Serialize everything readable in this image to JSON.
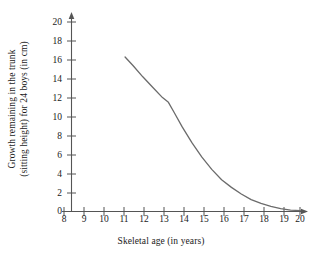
{
  "chart_data": {
    "type": "line",
    "title": "",
    "xlabel": "Skeletal age (in years)",
    "ylabel": "Growth remaining in the trunk (sitting height) for 24 boys (in cm)",
    "ylabel_line1": "Growth remaining in the trunk",
    "ylabel_line2": "(sitting height) for 24 boys (in cm)",
    "xlim": [
      8,
      20
    ],
    "ylim": [
      0,
      20
    ],
    "xticks": [
      8,
      9,
      10,
      11,
      12,
      13,
      14,
      15,
      16,
      17,
      18,
      19,
      20
    ],
    "yticks": [
      0,
      2,
      4,
      6,
      8,
      10,
      12,
      14,
      16,
      18,
      20
    ],
    "xtick_labels": [
      "8",
      "9",
      "10",
      "11",
      "12",
      "13",
      "14",
      "15",
      "16",
      "17",
      "18",
      "19",
      "20"
    ],
    "ytick_labels": [
      "0",
      "2",
      "4",
      "6",
      "8",
      "10",
      "12",
      "14",
      "16",
      "18",
      "20"
    ],
    "grid": false,
    "legend": false,
    "legend_position": "none",
    "axis_arrows": true,
    "line_color": "#6b6b6b",
    "axis_color": "#555555",
    "series": [
      {
        "name": "Growth remaining in trunk",
        "x": [
          11.1,
          11.5,
          12.0,
          12.5,
          13.0,
          13.3,
          13.6,
          14.0,
          14.5,
          15.0,
          15.5,
          16.0,
          16.5,
          17.0,
          17.5,
          18.0,
          18.5,
          19.0,
          19.5,
          20.0
        ],
        "values": [
          16.3,
          15.4,
          14.2,
          13.1,
          12.0,
          11.5,
          10.4,
          8.9,
          7.2,
          5.7,
          4.4,
          3.3,
          2.5,
          1.8,
          1.2,
          0.8,
          0.5,
          0.25,
          0.1,
          0.05
        ]
      }
    ]
  }
}
